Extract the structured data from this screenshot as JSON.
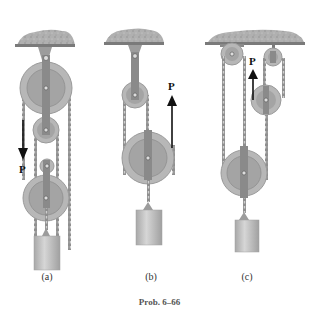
{
  "figure": {
    "caption": "Prob. 6–66",
    "colors": {
      "ceiling": "#a9a9a9",
      "pulley_outer": "#b5b5b5",
      "pulley_inner": "#a3a3a3",
      "strap": "#8a8a8a",
      "chain": "#7a7a7a",
      "weight": "#c4c4c4",
      "arrow": "#111111"
    },
    "panels": [
      {
        "id": "a",
        "label": "(a)",
        "force_label": "P",
        "force_direction": "down"
      },
      {
        "id": "b",
        "label": "(b)",
        "force_label": "P",
        "force_direction": "up"
      },
      {
        "id": "c",
        "label": "(c)",
        "force_label": "P",
        "force_direction": "up"
      }
    ]
  }
}
